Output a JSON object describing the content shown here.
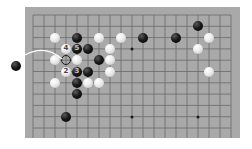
{
  "board": {
    "size": 19,
    "visible_rows": 12,
    "colors": {
      "board": "#a9a9a9",
      "lines": "#6a6a6a",
      "background": "#ffffff"
    },
    "grid": {
      "origin_x": 8,
      "origin_y": 8,
      "spacing_x": 11,
      "spacing_y": 11.3
    },
    "star_points": [
      {
        "col": 9,
        "row": 3
      },
      {
        "col": 9,
        "row": 9
      },
      {
        "col": 15,
        "row": 9
      },
      {
        "col": 3,
        "row": 3
      },
      {
        "col": 15,
        "row": 3
      },
      {
        "col": 3,
        "row": 9
      }
    ],
    "stones": [
      {
        "color": "black",
        "col": 15,
        "row": 1,
        "label": ""
      },
      {
        "color": "white",
        "col": 2,
        "row": 2,
        "label": ""
      },
      {
        "color": "black",
        "col": 4,
        "row": 2,
        "label": ""
      },
      {
        "color": "white",
        "col": 6,
        "row": 2,
        "label": ""
      },
      {
        "color": "white",
        "col": 8,
        "row": 2,
        "label": ""
      },
      {
        "color": "black",
        "col": 10,
        "row": 2,
        "label": ""
      },
      {
        "color": "black",
        "col": 13,
        "row": 2,
        "label": ""
      },
      {
        "color": "white",
        "col": 16,
        "row": 2,
        "label": ""
      },
      {
        "color": "white",
        "col": 3,
        "row": 3,
        "label": "4"
      },
      {
        "color": "black",
        "col": 4,
        "row": 3,
        "label": "5"
      },
      {
        "color": "black",
        "col": 5,
        "row": 3,
        "label": ""
      },
      {
        "color": "white",
        "col": 7,
        "row": 3,
        "label": ""
      },
      {
        "color": "white",
        "col": 15,
        "row": 3,
        "label": ""
      },
      {
        "color": "white",
        "col": 2,
        "row": 4,
        "label": ""
      },
      {
        "color": "empty-mark",
        "col": 3,
        "row": 4,
        "label": ""
      },
      {
        "color": "white",
        "col": 4,
        "row": 4,
        "label": ""
      },
      {
        "color": "black",
        "col": 6,
        "row": 4,
        "label": ""
      },
      {
        "color": "white",
        "col": 7,
        "row": 4,
        "label": ""
      },
      {
        "color": "white",
        "col": 3,
        "row": 5,
        "label": "2"
      },
      {
        "color": "black",
        "col": 4,
        "row": 5,
        "label": "3"
      },
      {
        "color": "black",
        "col": 5,
        "row": 5,
        "label": ""
      },
      {
        "color": "white",
        "col": 7,
        "row": 5,
        "label": ""
      },
      {
        "color": "white",
        "col": 16,
        "row": 5,
        "label": ""
      },
      {
        "color": "white",
        "col": 2,
        "row": 6,
        "label": ""
      },
      {
        "color": "black",
        "col": 4,
        "row": 6,
        "label": ""
      },
      {
        "color": "white",
        "col": 5,
        "row": 6,
        "label": ""
      },
      {
        "color": "white",
        "col": 6,
        "row": 6,
        "label": ""
      },
      {
        "color": "black",
        "col": 4,
        "row": 7,
        "label": ""
      },
      {
        "color": "black",
        "col": 3,
        "row": 9,
        "label": ""
      }
    ],
    "offboard_stone": {
      "color": "black"
    },
    "arrow": {
      "color": "#ffffff",
      "from": "offboard-stone",
      "to": "marked-empty-point"
    }
  }
}
